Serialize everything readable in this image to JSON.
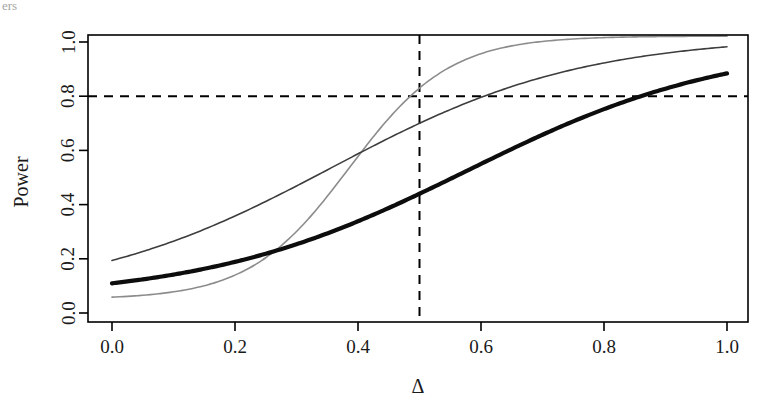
{
  "figure": {
    "width": 777,
    "height": 403,
    "background": "#ffffff",
    "clipped_header_text": "ers"
  },
  "chart_data": {
    "type": "line",
    "title": "",
    "subtitle": "",
    "xlabel": "Δ",
    "ylabel": "Power",
    "xlim": [
      -0.04,
      1.04
    ],
    "ylim": [
      -0.03,
      1.05
    ],
    "xticks": [
      0.0,
      0.2,
      0.4,
      0.6,
      0.8,
      1.0
    ],
    "xtick_labels": [
      "0.0",
      "0.2",
      "0.4",
      "0.6",
      "0.8",
      "1.0"
    ],
    "yticks": [
      0.0,
      0.2,
      0.4,
      0.6,
      0.8,
      1.0
    ],
    "ytick_labels": [
      "0.0",
      "0.2",
      "0.4",
      "0.6",
      "0.8",
      "1.0"
    ],
    "grid": false,
    "legend": null,
    "frame": "box",
    "x": [
      0.0,
      0.05,
      0.1,
      0.15,
      0.2,
      0.25,
      0.3,
      0.35,
      0.4,
      0.45,
      0.5,
      0.55,
      0.6,
      0.65,
      0.7,
      0.75,
      0.8,
      0.85,
      0.9,
      0.95,
      1.0
    ],
    "series": [
      {
        "name": "curve-light-gray",
        "color": "#8c8c8c",
        "line_width": 1.6,
        "line_style": "solid",
        "values": [
          0.05,
          0.058,
          0.079,
          0.114,
          0.165,
          0.233,
          0.316,
          0.41,
          0.51,
          0.61,
          0.83,
          0.79,
          0.855,
          0.905,
          0.94,
          0.963,
          0.979,
          0.989,
          0.996,
          1.0,
          1.01
        ]
      },
      {
        "name": "curve-dark-gray",
        "color": "#3d3d3d",
        "line_width": 1.6,
        "line_style": "solid",
        "values": [
          0.05,
          0.055,
          0.068,
          0.09,
          0.122,
          0.166,
          0.222,
          0.29,
          0.37,
          0.45,
          0.7,
          0.7,
          0.8,
          0.865,
          0.91,
          0.945,
          0.967,
          0.982,
          0.993,
          1.003,
          1.01
        ]
      },
      {
        "name": "curve-black-thick",
        "color": "#0d0d0d",
        "line_width": 4.2,
        "line_style": "solid",
        "values": [
          0.05,
          0.053,
          0.062,
          0.077,
          0.098,
          0.126,
          0.163,
          0.208,
          0.262,
          0.325,
          0.44,
          0.47,
          0.545,
          0.62,
          0.685,
          0.745,
          0.795,
          0.838,
          0.872,
          0.903,
          0.93
        ]
      }
    ],
    "reference_lines": [
      {
        "name": "power-threshold",
        "orientation": "horizontal",
        "value": 0.8,
        "style": "dashed",
        "color": "#000000"
      },
      {
        "name": "delta-reference",
        "orientation": "vertical",
        "value": 0.5,
        "style": "dashed",
        "color": "#000000"
      }
    ],
    "annotations": [
      {
        "name": "alpha-intercept",
        "text": "",
        "x": 0.0,
        "y": 0.05
      }
    ],
    "threshold_crossings": [
      {
        "series": "curve-light-gray",
        "power": 0.8,
        "delta": 0.485
      },
      {
        "series": "curve-dark-gray",
        "power": 0.8,
        "delta": 0.605
      },
      {
        "series": "curve-black-thick",
        "power": 0.8,
        "delta": 0.86
      }
    ]
  },
  "geometry": {
    "plot_left": 88,
    "plot_right": 748,
    "plot_top": 35,
    "plot_bottom": 322,
    "x_zero_px": 112,
    "x_one_px": 727,
    "y_zero_px": 313,
    "y_one_px": 42
  }
}
